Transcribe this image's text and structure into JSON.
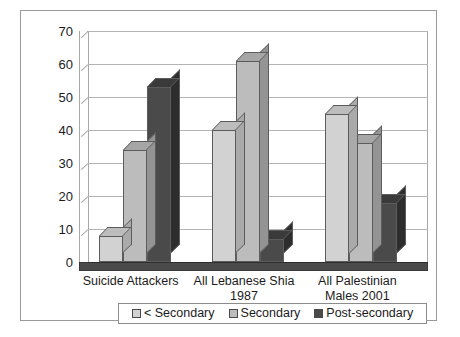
{
  "chart_data": {
    "type": "bar",
    "title": "",
    "subtitle": "",
    "xlabel": "",
    "ylabel": "",
    "ylim": [
      0,
      70
    ],
    "ytick_step": 10,
    "yticks": [
      "70",
      "60",
      "50",
      "40",
      "30",
      "20",
      "10",
      "0"
    ],
    "grid": true,
    "style": "3d-clustered-column",
    "legend_position": "bottom",
    "categories": [
      "Suicide Attackers",
      "All Lebanese Shia 1987",
      "All Palestinian Males 2001"
    ],
    "category_lines": [
      [
        "Suicide Attackers"
      ],
      [
        "All Lebanese Shia",
        "1987"
      ],
      [
        "All Palestinian",
        "Males 2001"
      ]
    ],
    "series": [
      {
        "name": "< Secondary",
        "color": "#d2d2d2",
        "top_color": "#bdbdbd",
        "side_color": "#aaaaaa",
        "values": [
          8,
          40,
          45
        ]
      },
      {
        "name": "Secondary",
        "color": "#bcbcbc",
        "top_color": "#a6a6a6",
        "side_color": "#949494",
        "values": [
          34,
          61,
          36
        ]
      },
      {
        "name": "Post-secondary",
        "color": "#4a4a4a",
        "top_color": "#3a3a3a",
        "side_color": "#2d2d2d",
        "values": [
          53,
          7,
          18
        ]
      }
    ]
  },
  "legend": {
    "items": [
      {
        "label": "< Secondary",
        "color": "#d2d2d2"
      },
      {
        "label": "Secondary",
        "color": "#bcbcbc"
      },
      {
        "label": "Post-secondary",
        "color": "#4a4a4a"
      }
    ]
  },
  "colors": {
    "frame_border": "#9a9a9a",
    "gridline": "#b4b4b4",
    "axis": "#a8a8a8",
    "text": "#1b1b1b",
    "background": "#ffffff"
  }
}
